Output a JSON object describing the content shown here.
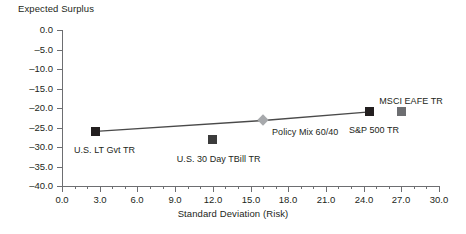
{
  "chart_data": {
    "type": "scatter",
    "title": "",
    "ylabel": "Expected Surplus",
    "xlabel": "Standard Deviation (Risk)",
    "xlim": [
      0.0,
      30.0
    ],
    "ylim": [
      -40.0,
      0.0
    ],
    "grid": false,
    "legend_position": "none",
    "x_ticks": [
      "0.0",
      "3.0",
      "6.0",
      "9.0",
      "12.0",
      "15.0",
      "18.0",
      "21.0",
      "24.0",
      "27.0",
      "30.0"
    ],
    "x_tick_values": [
      0.0,
      3.0,
      6.0,
      9.0,
      12.0,
      15.0,
      18.0,
      21.0,
      24.0,
      27.0,
      30.0
    ],
    "x_minor_tick_interval": 1.0,
    "y_ticks": [
      "0.0",
      "–5.0",
      "–10.0",
      "–15.0",
      "–20.0",
      "–25.0",
      "–30.0",
      "–35.0",
      "–40.0"
    ],
    "y_tick_values": [
      0.0,
      -5.0,
      -10.0,
      -15.0,
      -20.0,
      -25.0,
      -30.0,
      -35.0,
      -40.0
    ],
    "points": [
      {
        "label": "U.S. LT Gvt TR",
        "x": 2.7,
        "y": -26.0,
        "marker": "square",
        "color": "#231f20",
        "label_dx": -22,
        "label_dy": 14
      },
      {
        "label": "U.S. 30 Day TBill TR",
        "x": 12.0,
        "y": -28.2,
        "marker": "square",
        "color": "#3b3b3b",
        "label_dx": -36,
        "label_dy": 14
      },
      {
        "label": "Policy Mix 60/40",
        "x": 16.0,
        "y": -23.2,
        "marker": "diamond",
        "color": "#a7a9ac",
        "label_dx": 9,
        "label_dy": 7
      },
      {
        "label": "S&P 500 TR",
        "x": 24.5,
        "y": -21.0,
        "marker": "square",
        "color": "#231f20",
        "label_dx": -21,
        "label_dy": 13
      },
      {
        "label": "MSCI EAFE TR",
        "x": 27.0,
        "y": -21.0,
        "marker": "square",
        "color": "#6d6e71",
        "label_dx": -22,
        "label_dy": -16
      }
    ],
    "frontier_line": {
      "name": "Efficient Frontier",
      "color": "#4a4a4a",
      "x": [
        2.7,
        16.0,
        24.5
      ],
      "y": [
        -26.0,
        -23.2,
        -21.0
      ]
    }
  },
  "axes": {
    "y_title": "Expected Surplus",
    "x_title": "Standard Deviation (Risk)"
  }
}
